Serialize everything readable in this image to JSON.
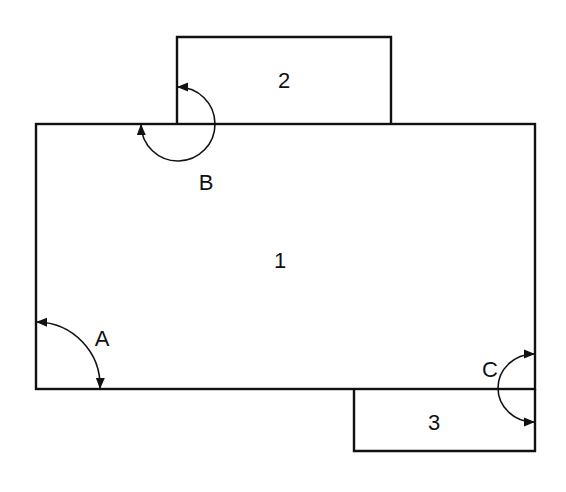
{
  "diagram": {
    "type": "floor-plan angle diagram",
    "stroke_color": "#111111",
    "background": "#ffffff",
    "regions": [
      {
        "id": "1",
        "label": "1"
      },
      {
        "id": "2",
        "label": "2"
      },
      {
        "id": "3",
        "label": "3"
      }
    ],
    "angles": [
      {
        "id": "A",
        "label": "A"
      },
      {
        "id": "B",
        "label": "B"
      },
      {
        "id": "C",
        "label": "C"
      }
    ]
  }
}
